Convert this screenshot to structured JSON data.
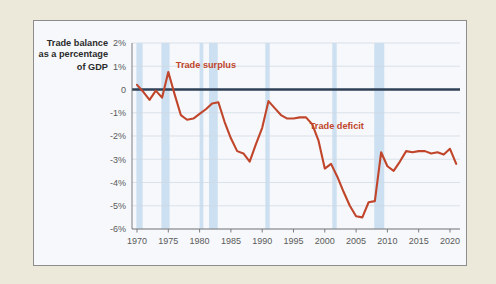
{
  "figure": {
    "background_color": "#ece9da",
    "panel_color": "#f6f8fb",
    "border_color": "#8d8d8d"
  },
  "axis_title": {
    "line1": "Trade balance",
    "line2": "as a percentage",
    "line3": "of GDP"
  },
  "annotations": {
    "surplus": "Trade surplus",
    "deficit": "Trade deficit"
  },
  "chart_data": {
    "type": "line",
    "xlabel": "",
    "ylabel": "Trade balance as a percentage of GDP",
    "xlim": [
      1969.2,
      2021.6
    ],
    "ylim": [
      -6,
      2
    ],
    "grid": true,
    "legend_position": "none",
    "line_color": "#c0452a",
    "zero_line_color": "#2e4157",
    "recession_band_color": "#c5dcee",
    "ytick_labels": [
      "2%",
      "1%",
      "0",
      "-1%",
      "-2%",
      "-3%",
      "-4%",
      "-5%",
      "-6%"
    ],
    "ytick_values": [
      2,
      1,
      0,
      -1,
      -2,
      -3,
      -4,
      -5,
      -6
    ],
    "xtick_labels": [
      "1970",
      "1975",
      "1980",
      "1985",
      "1990",
      "1995",
      "2000",
      "2005",
      "2010",
      "2015",
      "2020"
    ],
    "xtick_values": [
      1970,
      1975,
      1980,
      1985,
      1990,
      1995,
      2000,
      2005,
      2010,
      2015,
      2020
    ],
    "annotations": [
      {
        "text": "Trade surplus",
        "x": 1976.2,
        "y": 1.05,
        "color": "#c0452a"
      },
      {
        "text": "Trade deficit",
        "x": 1997.6,
        "y": -1.55,
        "color": "#c0452a"
      }
    ],
    "recession_bands": [
      {
        "start": 1969.9,
        "end": 1970.9
      },
      {
        "start": 1973.9,
        "end": 1975.2
      },
      {
        "start": 1980.0,
        "end": 1980.6
      },
      {
        "start": 1981.5,
        "end": 1982.9
      },
      {
        "start": 1990.5,
        "end": 1991.2
      },
      {
        "start": 2001.2,
        "end": 2001.9
      },
      {
        "start": 2007.9,
        "end": 2009.5
      }
    ],
    "x": [
      1970,
      1971,
      1972,
      1973,
      1974,
      1975,
      1976,
      1977,
      1978,
      1979,
      1980,
      1981,
      1982,
      1983,
      1984,
      1985,
      1986,
      1987,
      1988,
      1989,
      1990,
      1991,
      1992,
      1993,
      1994,
      1995,
      1996,
      1997,
      1998,
      1999,
      2000,
      2001,
      2002,
      2003,
      2004,
      2005,
      2006,
      2007,
      2008,
      2009,
      2010,
      2011,
      2012,
      2013,
      2014,
      2015,
      2016,
      2017,
      2018,
      2019,
      2020,
      2021
    ],
    "series": [
      {
        "name": "Trade balance as a percentage of GDP",
        "values": [
          0.2,
          -0.1,
          -0.45,
          -0.05,
          -0.35,
          0.75,
          -0.2,
          -1.1,
          -1.3,
          -1.25,
          -1.05,
          -0.85,
          -0.6,
          -0.55,
          -1.4,
          -2.1,
          -2.65,
          -2.75,
          -3.1,
          -2.35,
          -1.65,
          -0.5,
          -0.8,
          -1.1,
          -1.25,
          -1.25,
          -1.2,
          -1.2,
          -1.5,
          -2.2,
          -3.4,
          -3.2,
          -3.75,
          -4.4,
          -5.0,
          -5.45,
          -5.5,
          -4.85,
          -4.8,
          -2.7,
          -3.3,
          -3.5,
          -3.1,
          -2.65,
          -2.7,
          -2.65,
          -2.65,
          -2.75,
          -2.7,
          -2.8,
          -2.55,
          -3.2
        ]
      }
    ]
  }
}
